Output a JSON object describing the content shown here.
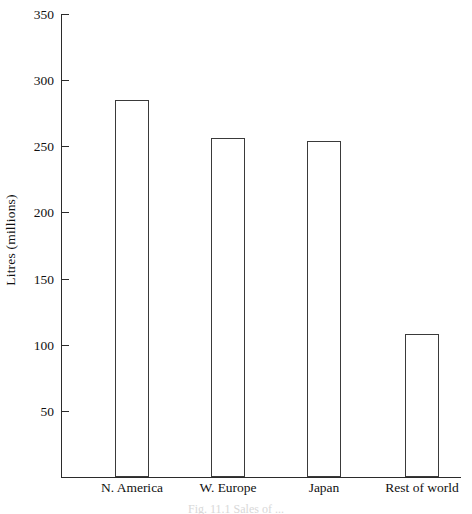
{
  "chart_data": {
    "type": "bar",
    "title": "",
    "xlabel": "",
    "ylabel": "Litres (millions)",
    "categories": [
      "N. America",
      "W. Europe",
      "Japan",
      "Rest of world"
    ],
    "values": [
      285,
      256,
      254,
      108
    ],
    "ylim": [
      0,
      350
    ],
    "ytick_labels": [
      "50",
      "100",
      "150",
      "200",
      "250",
      "300",
      "350"
    ],
    "ytick_values": [
      50,
      100,
      150,
      200,
      250,
      300,
      350
    ],
    "grid": false,
    "legend": null,
    "bar_style": {
      "fill": "#ffffff",
      "edge": "#3a3a3a"
    },
    "axis_color": "#2b2b2b"
  },
  "figure": {
    "caption_fragment": "Fig. 11.1    Sales of ..."
  }
}
